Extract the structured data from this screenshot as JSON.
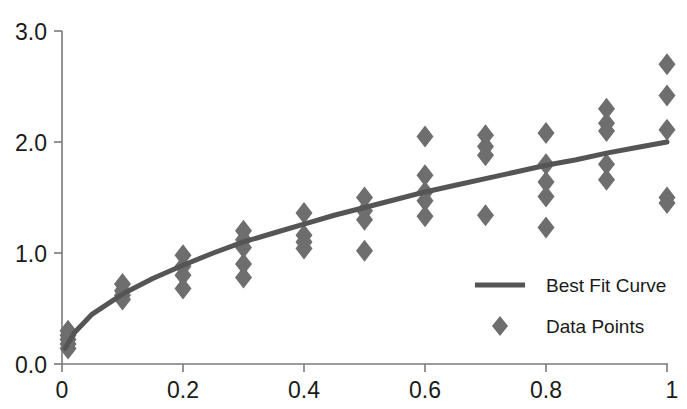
{
  "chart_data": {
    "type": "scatter",
    "title": "",
    "subtitle": "",
    "xlabel": "",
    "ylabel": "",
    "xlim": [
      0,
      1
    ],
    "ylim": [
      0,
      3
    ],
    "grid": false,
    "legend_position": "inside-right",
    "x_ticks": [
      0,
      0.2,
      0.4,
      0.6,
      0.8,
      1
    ],
    "x_tick_labels": [
      "0",
      "0.2",
      "0.4",
      "0.6",
      "0.8",
      "1"
    ],
    "y_ticks": [
      0,
      1,
      2,
      3
    ],
    "y_tick_labels": [
      "0.0",
      "1.0",
      "2.0",
      "3.0"
    ],
    "series": [
      {
        "name": "Best Fit Curve",
        "type": "line",
        "color": "#555555",
        "equation": "y = 2.00 * sqrt(x)",
        "x": [
          0.005,
          0.02,
          0.05,
          0.1,
          0.15,
          0.2,
          0.25,
          0.3,
          0.35,
          0.4,
          0.45,
          0.5,
          0.55,
          0.6,
          0.65,
          0.7,
          0.75,
          0.8,
          0.85,
          0.9,
          0.95,
          1.0
        ],
        "values": [
          0.14,
          0.28,
          0.45,
          0.63,
          0.77,
          0.89,
          1.0,
          1.1,
          1.18,
          1.26,
          1.34,
          1.41,
          1.48,
          1.55,
          1.61,
          1.67,
          1.73,
          1.79,
          1.84,
          1.9,
          1.95,
          2.0
        ]
      },
      {
        "name": "Data Points",
        "type": "scatter",
        "color": "#6e6e6e",
        "points": [
          [
            0.01,
            0.3
          ],
          [
            0.01,
            0.26
          ],
          [
            0.01,
            0.22
          ],
          [
            0.01,
            0.18
          ],
          [
            0.01,
            0.14
          ],
          [
            0.1,
            0.72
          ],
          [
            0.1,
            0.66
          ],
          [
            0.1,
            0.62
          ],
          [
            0.1,
            0.58
          ],
          [
            0.2,
            0.98
          ],
          [
            0.2,
            0.88
          ],
          [
            0.2,
            0.8
          ],
          [
            0.2,
            0.68
          ],
          [
            0.3,
            1.2
          ],
          [
            0.3,
            1.12
          ],
          [
            0.3,
            1.05
          ],
          [
            0.3,
            0.9
          ],
          [
            0.3,
            0.78
          ],
          [
            0.4,
            1.36
          ],
          [
            0.4,
            1.16
          ],
          [
            0.4,
            1.1
          ],
          [
            0.4,
            1.04
          ],
          [
            0.5,
            1.5
          ],
          [
            0.5,
            1.38
          ],
          [
            0.5,
            1.3
          ],
          [
            0.5,
            1.02
          ],
          [
            0.6,
            2.05
          ],
          [
            0.6,
            1.7
          ],
          [
            0.6,
            1.55
          ],
          [
            0.6,
            1.47
          ],
          [
            0.6,
            1.33
          ],
          [
            0.7,
            2.06
          ],
          [
            0.7,
            1.96
          ],
          [
            0.7,
            1.88
          ],
          [
            0.7,
            1.34
          ],
          [
            0.8,
            2.08
          ],
          [
            0.8,
            1.8
          ],
          [
            0.8,
            1.64
          ],
          [
            0.8,
            1.51
          ],
          [
            0.8,
            1.23
          ],
          [
            0.9,
            2.3
          ],
          [
            0.9,
            2.17
          ],
          [
            0.9,
            2.1
          ],
          [
            0.9,
            1.8
          ],
          [
            0.9,
            1.66
          ],
          [
            1.0,
            2.7
          ],
          [
            1.0,
            2.42
          ],
          [
            1.0,
            2.11
          ],
          [
            1.0,
            1.5
          ],
          [
            1.0,
            1.45
          ]
        ]
      }
    ],
    "legend_entries": [
      {
        "label": "Best Fit Curve",
        "marker": "line",
        "color": "#555555"
      },
      {
        "label": "Data Points",
        "marker": "diamond",
        "color": "#6e6e6e"
      }
    ]
  },
  "axes": {
    "y_labels": [
      "3.0",
      "2.0",
      "1.0",
      "0.0"
    ],
    "x_labels": [
      "0",
      "0.2",
      "0.4",
      "0.6",
      "0.8",
      "1"
    ]
  },
  "legend": {
    "best_fit_label": "Best Fit Curve",
    "data_points_label": "Data Points"
  },
  "colors": {
    "curve": "#555555",
    "marker": "#6e6e6e",
    "axis": "#7a7a7a",
    "text": "#1a1a1a",
    "background": "#ffffff"
  }
}
